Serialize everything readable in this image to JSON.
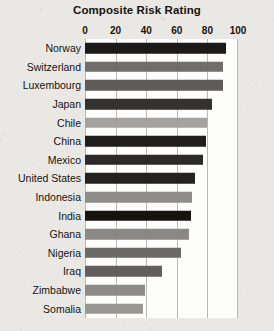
{
  "chart_data": {
    "type": "bar",
    "orientation": "horizontal",
    "title": "Composite Risk Rating",
    "xlabel": "",
    "ylabel": "",
    "xlim": [
      0,
      100
    ],
    "xticks": [
      0,
      20,
      40,
      60,
      80,
      100
    ],
    "xtick_labels": [
      "0",
      "20",
      "40",
      "60",
      "80",
      "100"
    ],
    "grid": true,
    "grid_axis": "x",
    "legend": false,
    "categories": [
      "Norway",
      "Switzerland",
      "Luxembourg",
      "Japan",
      "Chile",
      "China",
      "Mexico",
      "United States",
      "Indonesia",
      "India",
      "Ghana",
      "Nigeria",
      "Iraq",
      "Zimbabwe",
      "Somalia"
    ],
    "values": [
      92,
      90,
      90,
      83,
      80,
      79,
      77,
      72,
      70,
      69,
      68,
      63,
      50,
      39,
      38
    ],
    "bar_colors": [
      "#1b1a18",
      "#6f6e6a",
      "#5d5c58",
      "#333230",
      "#a3a29e",
      "#1f1e1c",
      "#2b2a28",
      "#232220",
      "#8e8d89",
      "#15140f",
      "#8a8985",
      "#6b6a66",
      "#61605c",
      "#8c8b87",
      "#97968f"
    ]
  },
  "colors": {
    "background": "#e9e8e4",
    "plot_background": "#fdfdfc",
    "gridline": "#b9b8b4",
    "text": "#15130f"
  }
}
